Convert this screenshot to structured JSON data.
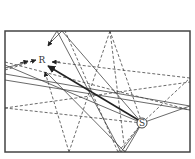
{
  "diagram": {
    "type": "ray-tracing",
    "room": {
      "x": 5,
      "y": 31,
      "width": 185,
      "height": 121,
      "stroke": "#444444"
    },
    "source": {
      "label": "S",
      "x": 142,
      "y": 123
    },
    "receiver": {
      "label": "R",
      "x": 42,
      "y": 60
    },
    "colors": {
      "line": "#444444",
      "direct": "#222222"
    },
    "direct_ray": {
      "from": [
        140,
        121
      ],
      "to": [
        48,
        66
      ]
    },
    "solid_rays": [
      [
        [
          142,
          123
        ],
        [
          121,
          152
        ]
      ],
      [
        [
          121,
          152
        ],
        [
          57,
          31
        ]
      ],
      [
        [
          57,
          31
        ],
        [
          48,
          45
        ]
      ],
      [
        [
          142,
          123
        ],
        [
          190,
          106
        ]
      ],
      [
        [
          190,
          106
        ],
        [
          5,
          74
        ]
      ],
      [
        [
          142,
          123
        ],
        [
          62,
          31
        ]
      ],
      [
        [
          62,
          31
        ],
        [
          50,
          43
        ]
      ],
      [
        [
          142,
          123
        ],
        [
          5,
          65
        ]
      ],
      [
        [
          142,
          123
        ],
        [
          125,
          152
        ]
      ],
      [
        [
          125,
          152
        ],
        [
          46,
          72
        ]
      ],
      [
        [
          190,
          110
        ],
        [
          5,
          80
        ]
      ],
      [
        [
          5,
          68
        ],
        [
          28,
          62
        ]
      ]
    ],
    "dashed_rays": [
      [
        [
          142,
          123
        ],
        [
          190,
          78
        ]
      ],
      [
        [
          190,
          78
        ],
        [
          53,
          62
        ]
      ],
      [
        [
          142,
          123
        ],
        [
          110,
          31
        ]
      ],
      [
        [
          110,
          31
        ],
        [
          69,
          152
        ]
      ],
      [
        [
          69,
          152
        ],
        [
          45,
          72
        ]
      ],
      [
        [
          142,
          123
        ],
        [
          5,
          108
        ]
      ],
      [
        [
          5,
          108
        ],
        [
          190,
          82
        ]
      ],
      [
        [
          142,
          123
        ],
        [
          118,
          152
        ]
      ],
      [
        [
          118,
          152
        ],
        [
          65,
          31
        ]
      ],
      [
        [
          5,
          70
        ],
        [
          28,
          63
        ]
      ],
      [
        [
          110,
          31
        ],
        [
          125,
          152
        ]
      ],
      [
        [
          5,
          62
        ],
        [
          190,
          110
        ]
      ]
    ]
  }
}
